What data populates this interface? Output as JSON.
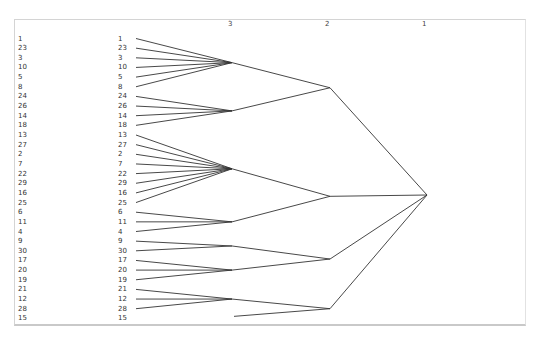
{
  "diagram": {
    "type": "dendrogram",
    "level_headers": [
      {
        "label": "3",
        "x": 228
      },
      {
        "label": "2",
        "x": 325
      },
      {
        "label": "1",
        "x": 422
      }
    ],
    "leaf_order": [
      "1",
      "23",
      "3",
      "10",
      "5",
      "8",
      "24",
      "26",
      "14",
      "18",
      "13",
      "27",
      "2",
      "7",
      "22",
      "29",
      "16",
      "25",
      "6",
      "11",
      "4",
      "9",
      "30",
      "17",
      "20",
      "19",
      "21",
      "12",
      "28",
      "15"
    ],
    "level3_clusters": [
      {
        "id": "g1",
        "members": [
          "1",
          "23",
          "3",
          "10",
          "5",
          "8"
        ]
      },
      {
        "id": "g2",
        "members": [
          "24",
          "26",
          "14",
          "18"
        ]
      },
      {
        "id": "g3",
        "members": [
          "13",
          "27",
          "2",
          "7",
          "22",
          "29",
          "16",
          "25"
        ]
      },
      {
        "id": "g4",
        "members": [
          "6",
          "11",
          "4"
        ]
      },
      {
        "id": "g5",
        "members": [
          "9",
          "30"
        ]
      },
      {
        "id": "g6",
        "members": [
          "17",
          "20",
          "19"
        ]
      },
      {
        "id": "g7",
        "members": [
          "21",
          "12",
          "28"
        ]
      },
      {
        "id": "g8",
        "members": [
          "15"
        ]
      }
    ],
    "level2_clusters": [
      {
        "id": "a",
        "children": [
          "g1",
          "g2"
        ]
      },
      {
        "id": "b",
        "children": [
          "g3",
          "g4"
        ]
      },
      {
        "id": "c",
        "children": [
          "g5",
          "g6"
        ]
      },
      {
        "id": "d",
        "children": [
          "g7",
          "g8"
        ]
      }
    ],
    "level1_root": {
      "children": [
        "a",
        "b",
        "c",
        "d"
      ]
    },
    "line_color": "#333333",
    "border_color": "#d4d4d4"
  }
}
